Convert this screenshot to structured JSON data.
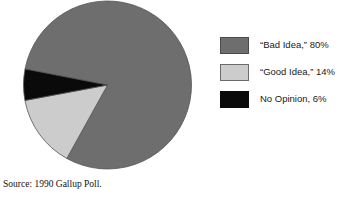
{
  "chart_data": {
    "type": "pie",
    "title": "",
    "labels": [
      "“Bad Idea,” 80%",
      "“Good Idea,” 14%",
      "No Opinion, 6%"
    ],
    "categories": [
      "“Bad Idea”",
      "“Good Idea”",
      "No Opinion"
    ],
    "values": [
      80,
      14,
      6
    ],
    "units": "percent",
    "colors": [
      "#6e6e6e",
      "#cccccc",
      "#0a0a0a"
    ],
    "slice_border_color": "#555555",
    "start_angle_deg": -169,
    "direction": "clockwise",
    "legend_position": "right",
    "grid": false,
    "source": "Source: 1990 Gallup Poll."
  },
  "legend": {
    "items": [
      {
        "label": "“Bad Idea,” 80%",
        "color": "#6e6e6e",
        "border": "#4a4a4a"
      },
      {
        "label": "“Good Idea,” 14%",
        "color": "#cccccc",
        "border": "#6b6b6b"
      },
      {
        "label": "No Opinion, 6%",
        "color": "#0a0a0a",
        "border": "#0a0a0a"
      }
    ]
  },
  "footer": {
    "source_text": "Source: 1990 Gallup Poll."
  }
}
